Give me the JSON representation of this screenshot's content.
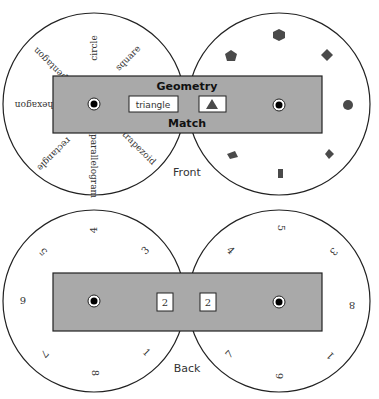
{
  "colors": {
    "slider_fill": "#a9a9a9",
    "outline": "#222222",
    "shape_fill": "#4a4a4a",
    "background": "#ffffff"
  },
  "front": {
    "caption": "Front",
    "title_top": "Geometry",
    "title_bottom": "Match",
    "window_word": "triangle",
    "window_shape": "triangle",
    "left_wheel_labels": [
      "circle",
      "square",
      "hexagon",
      "pentagon",
      "rectangle",
      "parallelogram",
      "trapezoid"
    ],
    "right_wheel_shapes": [
      "hexagon",
      "pentagon",
      "square",
      "circle",
      "parallelogram",
      "rectangle",
      "rhombus"
    ]
  },
  "back": {
    "caption": "Back",
    "window_left_value": "2",
    "window_right_value": "2",
    "left_wheel_numbers": [
      "4",
      "5",
      "9",
      "7",
      "8",
      "1",
      "3"
    ],
    "right_wheel_numbers": [
      "5",
      "4",
      "3",
      "8",
      "1",
      "6",
      "7"
    ]
  }
}
